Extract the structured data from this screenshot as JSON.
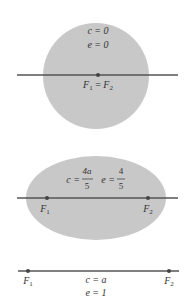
{
  "colors": {
    "fill": "#c8c8c8",
    "line": "#555555",
    "text": "#333333",
    "background": "#ffffff"
  },
  "panels": [
    {
      "shape": "circle",
      "c_label": "c = 0",
      "e_label": "e = 0",
      "foci_label": "F1 = F2",
      "foci": {
        "F": "F",
        "sub1": "1",
        "eq": " = ",
        "sub2": "2"
      }
    },
    {
      "shape": "ellipse",
      "c_label": "c = 4a/5",
      "e_label": "e = 4/5",
      "c": {
        "lhs": "c =",
        "num": "4a",
        "den": "5"
      },
      "e": {
        "lhs": "e =",
        "num": "4",
        "den": "5"
      },
      "foci": [
        {
          "F": "F",
          "sub": "1"
        },
        {
          "F": "F",
          "sub": "2"
        }
      ]
    },
    {
      "shape": "segment",
      "c_label": "c = a",
      "e_label": "e = 1",
      "foci": [
        {
          "F": "F",
          "sub": "1"
        },
        {
          "F": "F",
          "sub": "2"
        }
      ]
    }
  ]
}
